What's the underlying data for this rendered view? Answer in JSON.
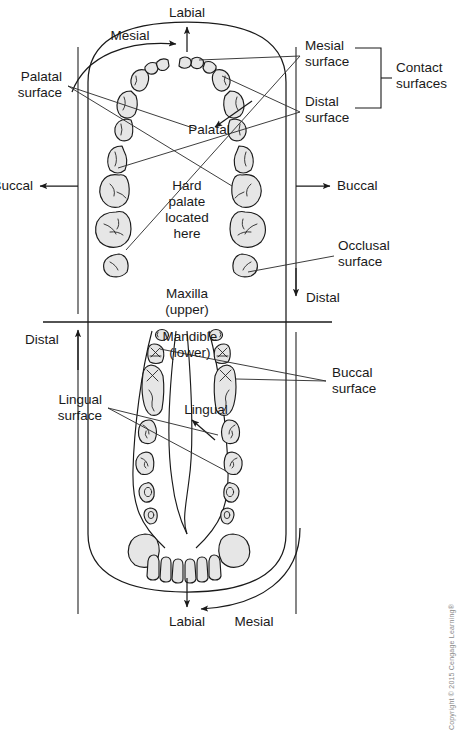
{
  "figure": {
    "colors": {
      "tooth_fill": "#e6e6e6",
      "outline": "#1a1a1a",
      "leader": "#333333",
      "copyright_text": "#8a8a8a"
    }
  },
  "maxilla": {
    "arch_label_line1": "Maxilla",
    "arch_label_line2": "(upper)",
    "center_note": [
      "Hard",
      "palate",
      "located",
      "here"
    ],
    "direction_labels": {
      "labial": "Labial",
      "mesial": "Mesial",
      "palatal": "Palatal",
      "buccal_left": "Buccal",
      "buccal_right": "Buccal",
      "distal": "Distal"
    },
    "callouts": {
      "palatal_surface_line1": "Palatal",
      "palatal_surface_line2": "surface",
      "mesial_surface_line1": "Mesial",
      "mesial_surface_line2": "surface",
      "distal_surface_line1": "Distal",
      "distal_surface_line2": "surface",
      "contact_surfaces_line1": "Contact",
      "contact_surfaces_line2": "surfaces",
      "occlusal_surface_line1": "Occlusal",
      "occlusal_surface_line2": "surface"
    }
  },
  "mandible": {
    "arch_label_line1": "Mandible",
    "arch_label_line2": "(lower)",
    "direction_labels": {
      "distal": "Distal",
      "lingual": "Lingual",
      "labial": "Labial",
      "mesial": "Mesial"
    },
    "callouts": {
      "buccal_surface_line1": "Buccal",
      "buccal_surface_line2": "surface",
      "lingual_surface_line1": "Lingual",
      "lingual_surface_line2": "surface"
    }
  },
  "credit": {
    "text": "Copyright © 2015 Cengage Learning®"
  }
}
